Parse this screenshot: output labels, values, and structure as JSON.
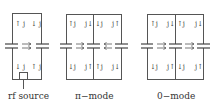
{
  "panels": [
    {
      "caption": "rf source",
      "cells": [
        {
          "tl": "↑ j",
          "tr": "↓ j",
          "bl": "↓ j",
          "br": "↑ j"
        }
      ],
      "field_arrows": [
        "right"
      ],
      "has_rf_source": true
    },
    {
      "caption": "π−mode",
      "cells": [
        {
          "tl": "↑j",
          "tr": "j↓",
          "bl": "↓j",
          "br": "j↑"
        },
        {
          "tl": "↓j",
          "tr": "j↑",
          "bl": "↑j",
          "br": "j↓"
        }
      ],
      "field_arrows": [
        "right",
        "left"
      ],
      "has_rf_source": false
    },
    {
      "caption": "0−mode",
      "cells": [
        {
          "tl": "↑j",
          "tr": "j↓",
          "bl": "↓j",
          "br": "j↑"
        },
        {
          "tl": "↑j",
          "tr": "j↓",
          "bl": "↓j",
          "br": "j↑"
        }
      ],
      "field_arrows": [
        "right",
        "right"
      ],
      "has_rf_source": false
    }
  ]
}
